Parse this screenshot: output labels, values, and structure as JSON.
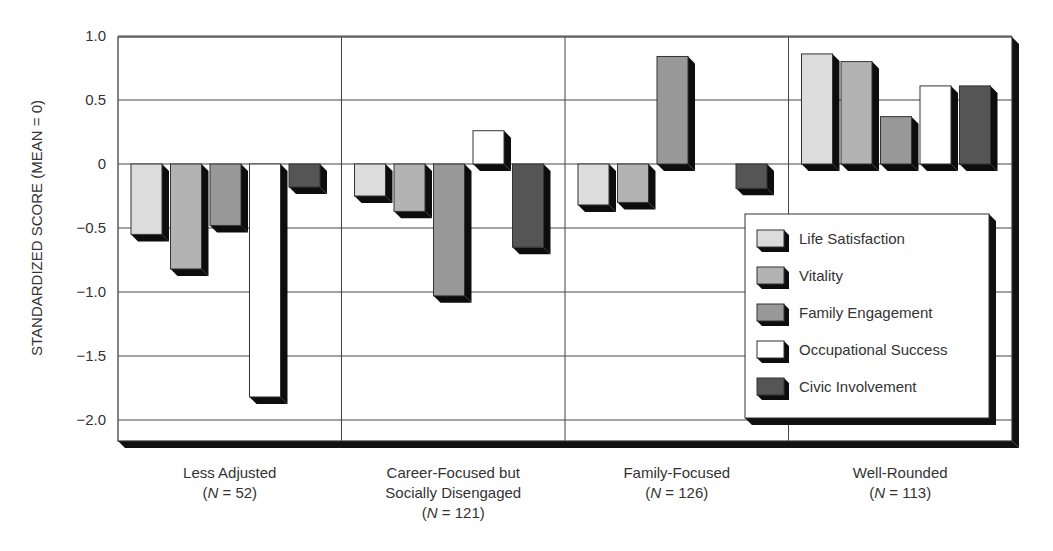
{
  "chart_data": {
    "type": "bar",
    "title": "",
    "xlabel": "",
    "ylabel": "STANDARDIZED SCORE (MEAN = 0)",
    "ylim": [
      -2.17,
      1.0
    ],
    "yticks": [
      1.0,
      0.5,
      0,
      -0.5,
      -1.0,
      -1.5,
      -2.0
    ],
    "ytick_labels": [
      "1.0",
      "0.5",
      "0",
      "−0.5",
      "−1.0",
      "−1.5",
      "−2.0"
    ],
    "grid": true,
    "legend_position": "inside-lower-right",
    "categories": [
      {
        "lines": [
          "Less Adjusted",
          "(N = 52)"
        ],
        "name": "Less Adjusted",
        "n": 52
      },
      {
        "lines": [
          "Career-Focused but",
          "Socially Disengaged",
          "(N = 121)"
        ],
        "name": "Career-Focused but Socially Disengaged",
        "n": 121
      },
      {
        "lines": [
          "Family-Focused",
          "(N = 126)"
        ],
        "name": "Family-Focused",
        "n": 126
      },
      {
        "lines": [
          "Well-Rounded",
          "(N = 113)"
        ],
        "name": "Well-Rounded",
        "n": 113
      }
    ],
    "series": [
      {
        "name": "Life Satisfaction",
        "color": "#dcdcdc",
        "values": [
          -0.55,
          -0.25,
          -0.32,
          0.86
        ]
      },
      {
        "name": "Vitality",
        "color": "#b3b3b3",
        "values": [
          -0.82,
          -0.37,
          -0.3,
          0.8
        ]
      },
      {
        "name": "Family Engagement",
        "color": "#989898",
        "values": [
          -0.48,
          -1.03,
          0.84,
          0.37
        ]
      },
      {
        "name": "Occupational Success",
        "color": "#ffffff",
        "values": [
          -1.82,
          0.26,
          0.0,
          0.61
        ]
      },
      {
        "name": "Civic Involvement",
        "color": "#555555",
        "values": [
          -0.18,
          -0.65,
          -0.19,
          0.61
        ]
      }
    ]
  }
}
